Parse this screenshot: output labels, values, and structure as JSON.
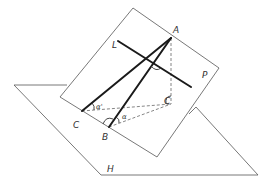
{
  "diagram": {
    "planes": {
      "P": {
        "label": "P"
      },
      "H": {
        "label": "H"
      }
    },
    "points": {
      "A": {
        "label": "A"
      },
      "B": {
        "label": "B"
      },
      "C": {
        "label": "C"
      },
      "C_foot": {
        "label": "C"
      }
    },
    "lines": {
      "L": {
        "label": "L"
      }
    },
    "angles": {
      "alpha": {
        "label": "α"
      },
      "alpha_prime": {
        "label": "α'"
      }
    },
    "colors": {
      "thin_line": "#555555",
      "thick_line": "#1a1a1a",
      "dashed_line": "#666666",
      "label": "#333333",
      "background": "#ffffff"
    }
  }
}
